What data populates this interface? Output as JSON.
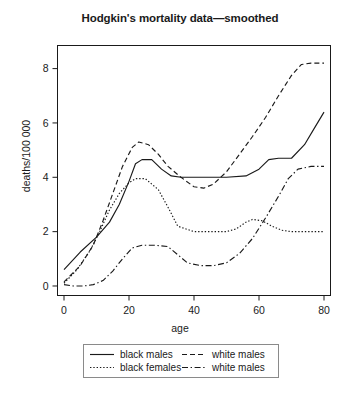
{
  "chart_data": {
    "type": "line",
    "title": "Hodgkin's mortality data—smoothed",
    "xlabel": "age",
    "ylabel": "deaths/100 000",
    "xlim": [
      -2,
      82
    ],
    "ylim": [
      -0.35,
      8.85
    ],
    "xticks": [
      0,
      20,
      40,
      60,
      80
    ],
    "yticks": [
      0,
      2,
      4,
      6,
      8
    ],
    "grid": false,
    "legend_position": "below-axes",
    "frame": true,
    "line_color": "#1a1a1a",
    "background": "#ffffff",
    "series": [
      {
        "name": "black males",
        "style": "solid",
        "x": [
          0,
          5,
          10,
          14,
          17,
          20,
          22,
          24,
          27,
          30,
          33,
          36,
          42,
          50,
          56,
          60,
          63,
          66,
          70,
          74,
          77,
          80
        ],
        "y": [
          0.6,
          1.25,
          1.8,
          2.35,
          3.0,
          3.85,
          4.5,
          4.65,
          4.65,
          4.3,
          4.05,
          4.0,
          4.0,
          4.0,
          4.05,
          4.3,
          4.65,
          4.7,
          4.7,
          5.2,
          5.8,
          6.4
        ]
      },
      {
        "name": "white males",
        "style": "dashed",
        "x": [
          0,
          5,
          9,
          12,
          15,
          18,
          21,
          23,
          26,
          29,
          32,
          36,
          40,
          43,
          46,
          50,
          54,
          58,
          62,
          66,
          70,
          73,
          76,
          80
        ],
        "y": [
          0.15,
          0.75,
          1.5,
          2.4,
          3.4,
          4.4,
          5.1,
          5.3,
          5.2,
          4.85,
          4.4,
          4.0,
          3.65,
          3.6,
          3.75,
          4.2,
          4.85,
          5.5,
          6.2,
          7.0,
          7.75,
          8.15,
          8.2,
          8.2
        ]
      },
      {
        "name": "black females",
        "style": "dotted",
        "x": [
          0,
          4,
          8,
          11,
          14,
          17,
          20,
          22,
          25,
          29,
          32,
          35,
          40,
          46,
          50,
          53,
          56,
          58,
          61,
          64,
          67,
          70,
          74,
          78,
          80
        ],
        "y": [
          0.1,
          0.6,
          1.3,
          2.0,
          2.8,
          3.4,
          3.8,
          3.95,
          3.95,
          3.55,
          2.9,
          2.2,
          2.0,
          2.0,
          2.0,
          2.1,
          2.35,
          2.45,
          2.4,
          2.2,
          2.05,
          2.0,
          2.0,
          2.0,
          2.0
        ]
      },
      {
        "name": "white males",
        "style": "dashdot",
        "x": [
          0,
          3,
          6,
          9,
          12,
          15,
          18,
          21,
          24,
          28,
          32,
          35,
          38,
          42,
          46,
          50,
          54,
          58,
          62,
          66,
          69,
          72,
          76,
          80
        ],
        "y": [
          0.05,
          0.0,
          0.0,
          0.05,
          0.2,
          0.55,
          1.0,
          1.4,
          1.5,
          1.5,
          1.45,
          1.15,
          0.85,
          0.75,
          0.75,
          0.85,
          1.2,
          1.75,
          2.5,
          3.3,
          3.95,
          4.3,
          4.4,
          4.4
        ]
      }
    ]
  },
  "legend": {
    "entries": [
      {
        "label": "black males",
        "style": "solid"
      },
      {
        "label": "white males",
        "style": "dashed"
      },
      {
        "label": "black females",
        "style": "dotted"
      },
      {
        "label": "white males",
        "style": "dashdot"
      }
    ]
  }
}
